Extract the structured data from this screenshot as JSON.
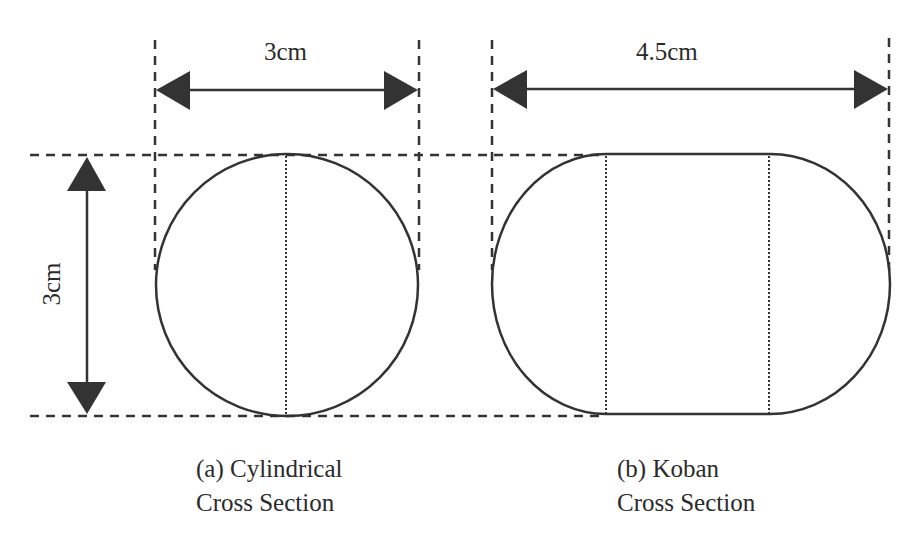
{
  "diagram": {
    "colors": {
      "stroke": "#333333",
      "background": "#ffffff"
    },
    "cylindrical": {
      "width_label": "3cm",
      "height_label": "3cm",
      "caption_line1": "(a) Cylindrical",
      "caption_line2": "Cross Section"
    },
    "koban": {
      "width_label": "4.5cm",
      "caption_line1": "(b) Koban",
      "caption_line2": "Cross Section"
    }
  }
}
